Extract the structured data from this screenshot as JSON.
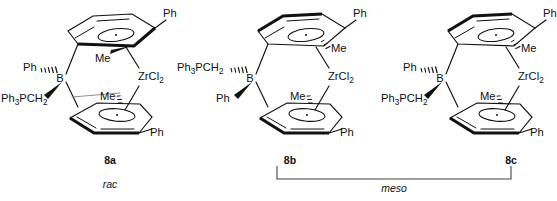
{
  "figure": {
    "background": "#ffffff",
    "ink": "#111111",
    "bracket_color": "#444444",
    "width": 557,
    "height": 201
  },
  "structures": [
    {
      "id": "8a",
      "compound_label": "8a",
      "stereo_label": "rac",
      "origin_x": 0,
      "labels": {
        "metal": "ZrCl",
        "metal_sub": "2",
        "boron": "B",
        "phenyl_top": "Ph",
        "phenyl_bottom": "Ph",
        "boron_sub_hashed": "Ph",
        "boron_sub_wedge_main": "Ph",
        "boron_sub_wedge_sub1": "3",
        "boron_sub_wedge_mid": "PCH",
        "boron_sub_wedge_sub2": "2",
        "methyl_top": "Me",
        "methyl_bottom": "Me"
      },
      "stereo": {
        "boron_hashed_substituent": "Ph",
        "boron_wedge_substituent": "Ph3PCH2",
        "boron_hashed_side": "upper-left",
        "boron_wedge_side": "lower-left",
        "top_methyl_bond": "bold-wedge",
        "top_methyl_side": "left",
        "bottom_methyl_bond": "hashed-wedge",
        "bottom_methyl_side": "left"
      }
    },
    {
      "id": "8b",
      "compound_label": "8b",
      "stereo_label": "",
      "origin_x": 190,
      "labels": {
        "metal": "ZrCl",
        "metal_sub": "2",
        "boron": "B",
        "phenyl_top": "Ph",
        "phenyl_bottom": "Ph",
        "boron_sub_hashed": "Ph",
        "boron_sub_wedge_main": "Ph",
        "boron_sub_wedge_sub1": "3",
        "boron_sub_wedge_mid": "PCH",
        "boron_sub_wedge_sub2": "2",
        "methyl_top": "Me",
        "methyl_bottom": "Me"
      },
      "stereo": {
        "boron_hashed_substituent": "Ph3PCH2",
        "boron_wedge_substituent": "Ph",
        "boron_hashed_side": "upper-left",
        "boron_wedge_side": "lower-left",
        "top_methyl_bond": "hashed-wedge",
        "top_methyl_side": "right",
        "bottom_methyl_bond": "hashed-wedge",
        "bottom_methyl_side": "left"
      }
    },
    {
      "id": "8c",
      "compound_label": "8c",
      "stereo_label": "",
      "origin_x": 380,
      "labels": {
        "metal": "ZrCl",
        "metal_sub": "2",
        "boron": "B",
        "phenyl_top": "Ph",
        "phenyl_bottom": "Ph",
        "boron_sub_hashed": "Ph",
        "boron_sub_wedge_main": "Ph",
        "boron_sub_wedge_sub1": "3",
        "boron_sub_wedge_mid": "PCH",
        "boron_sub_wedge_sub2": "2",
        "methyl_top": "Me",
        "methyl_bottom": "Me"
      },
      "stereo": {
        "boron_hashed_substituent": "Ph",
        "boron_wedge_substituent": "Ph3PCH2",
        "boron_hashed_side": "upper-left",
        "boron_wedge_side": "lower-left",
        "top_methyl_bond": "hashed-wedge",
        "top_methyl_side": "right",
        "bottom_methyl_bond": "hashed-wedge",
        "bottom_methyl_side": "left"
      }
    }
  ],
  "annotations": {
    "rac_label": "rac",
    "meso_label": "meso",
    "meso_bracket_spans": [
      "8b",
      "8c"
    ]
  }
}
